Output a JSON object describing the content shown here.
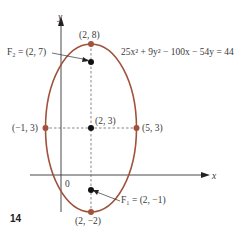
{
  "diagram": {
    "equation": "25x² + 9y² − 100x − 54y = 44",
    "figure_number": "14",
    "axes": {
      "x_label": "x",
      "y_label": "y",
      "origin_label": "0"
    },
    "points": {
      "top_vertex": "(2, 8)",
      "bottom_vertex": "(2, −2)",
      "left_vertex": "(−1, 3)",
      "right_vertex": "(5, 3)",
      "center": "(2, 3)",
      "focus_upper": "F₂ = (2, 7)",
      "focus_lower": "F₁ = (2, −1)"
    },
    "colors": {
      "ellipse": "#a0523a",
      "vertex": "#a0523a",
      "focus": "#111111",
      "axis": "#333333"
    }
  }
}
